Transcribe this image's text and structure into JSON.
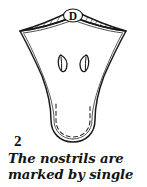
{
  "figure": {
    "number": "2",
    "caption_lines": [
      "The nostrils are",
      "marked by single"
    ],
    "label_in_drawing": "D",
    "colors": {
      "background": "#ffffff",
      "ink": "#1a1a1a",
      "hatch": "#333333",
      "light_ink": "#555555"
    },
    "drawing": {
      "subject": "carved-face-outline",
      "parts": [
        {
          "name": "hatched-brow-band",
          "label": "D",
          "style": "diagonal-hatching"
        },
        {
          "name": "left-nostril",
          "style": "almond-outline-with-center-line"
        },
        {
          "name": "right-nostril",
          "style": "almond-outline-with-center-line"
        },
        {
          "name": "outer-contour",
          "style": "solid-line"
        },
        {
          "name": "inner-contour",
          "style": "thin-parallel-line"
        },
        {
          "name": "bottom-inner-contour",
          "style": "dashed-line"
        }
      ]
    }
  }
}
